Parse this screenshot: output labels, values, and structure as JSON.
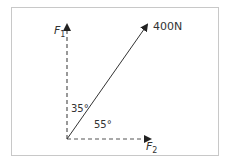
{
  "diagram": {
    "type": "force-vector-resolution",
    "resultant": {
      "label": "400N",
      "magnitude": "400",
      "unit": "N"
    },
    "components": [
      {
        "name": "F",
        "subscript": "1",
        "direction": "vertical"
      },
      {
        "name": "F",
        "subscript": "2",
        "direction": "horizontal"
      }
    ],
    "angles": [
      {
        "label": "35°",
        "between": "F1 and resultant"
      },
      {
        "label": "55°",
        "between": "F2 and resultant"
      }
    ],
    "colors": {
      "line": "#333333",
      "border": "#c8c8c8"
    }
  }
}
